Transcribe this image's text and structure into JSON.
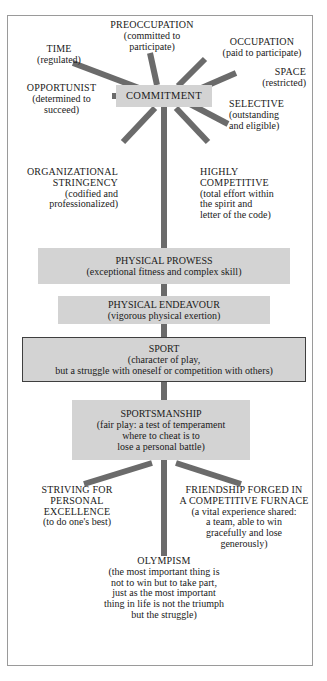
{
  "diagram": {
    "colors": {
      "frame_border": "#9a9a9a",
      "box_fill": "#d3d3d3",
      "box_outline": "#3f3f3f",
      "connector": "#6b6b6b",
      "text": "#1a1a1a",
      "background": "#ffffff"
    },
    "hub": {
      "label": "COMMITMENT"
    },
    "spokes": [
      {
        "id": "time",
        "caption": "TIME",
        "paren": "(regulated)",
        "align": "center",
        "position": "upper-left"
      },
      {
        "id": "preoccupation",
        "caption": "PREOCCUPATION",
        "paren": "(committed to\nparticipate)",
        "paren_lines": [
          "(committed to",
          "participate)"
        ],
        "align": "center",
        "position": "top"
      },
      {
        "id": "occupation",
        "caption": "OCCUPATION",
        "paren": "(paid to participate)",
        "align": "center",
        "position": "upper-right"
      },
      {
        "id": "space",
        "caption": "SPACE",
        "paren": "(restricted)",
        "align": "right",
        "position": "right-upper"
      },
      {
        "id": "selective",
        "caption": "SELECTIVE",
        "paren_lines": [
          "(outstanding",
          "and eligible)"
        ],
        "align": "left",
        "position": "right-lower"
      },
      {
        "id": "opportunist",
        "caption": "OPPORTUNIST",
        "paren_lines": [
          "(determined to",
          "succeed)"
        ],
        "align": "center",
        "position": "left"
      },
      {
        "id": "organizational-stringency",
        "caption_lines": [
          "ORGANIZATIONAL",
          "STRINGENCY"
        ],
        "paren_lines": [
          "(codified and",
          "professionalized)"
        ],
        "align": "right",
        "position": "lower-left"
      },
      {
        "id": "highly-competitive",
        "caption_lines": [
          "HIGHLY",
          "COMPETITIVE"
        ],
        "paren_lines": [
          "(total effort within",
          "the spirit and",
          "letter of the code)"
        ],
        "align": "left",
        "position": "lower-right"
      }
    ],
    "trunk_nodes": [
      {
        "id": "physical-prowess",
        "caption": "PHYSICAL PROWESS",
        "paren_lines": [
          "(exceptional fitness and complex skill)"
        ],
        "outlined": false
      },
      {
        "id": "physical-endeavour",
        "caption": "PHYSICAL ENDEAVOUR",
        "paren_lines": [
          "(vigorous physical exertion)"
        ],
        "outlined": false
      },
      {
        "id": "sport",
        "caption": "SPORT",
        "paren_lines": [
          "(character of play,",
          "but a struggle with oneself or competition with others)"
        ],
        "outlined": true
      },
      {
        "id": "sportsmanship",
        "caption": "SPORTSMANSHIP",
        "paren_lines": [
          "(fair play: a test of temperament",
          "where to cheat is to",
          "lose a personal battle)"
        ],
        "outlined": false
      }
    ],
    "branches": [
      {
        "id": "striving-for-personal-excellence",
        "caption_lines": [
          "STRIVING FOR",
          "PERSONAL",
          "EXCELLENCE"
        ],
        "paren_lines": [
          "(to do one's best)"
        ],
        "align": "center"
      },
      {
        "id": "friendship-forged",
        "caption_lines": [
          "FRIENDSHIP FORGED IN",
          "A COMPETITIVE FURNACE"
        ],
        "paren_lines": [
          "(a vital experience shared:",
          "a team, able to win",
          "gracefully and lose",
          "generously)"
        ],
        "align": "center"
      }
    ],
    "terminal": {
      "id": "olympism",
      "caption": "OLYMPISM",
      "paren_lines": [
        "(the most important thing is",
        "not to win but to take part,",
        "just as the most important",
        "thing in life is not the triumph",
        "but the struggle)"
      ]
    }
  }
}
